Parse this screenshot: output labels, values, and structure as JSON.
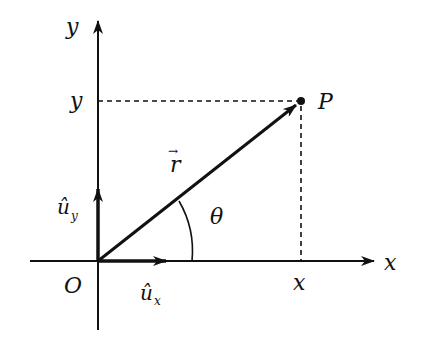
{
  "diagram": {
    "axes": {
      "x_axis_label": "x",
      "y_axis_label": "y",
      "origin_label": "O"
    },
    "point": {
      "label": "P",
      "x_projection_label": "x",
      "y_projection_label": "y"
    },
    "vector": {
      "label": "r",
      "arrow_glyph": "→"
    },
    "angle": {
      "label": "θ"
    },
    "unit_vectors": {
      "ux": {
        "base": "û",
        "subscript": "x"
      },
      "uy": {
        "base": "û",
        "subscript": "y"
      }
    },
    "colors": {
      "ink": "#111111",
      "background": "#ffffff"
    }
  }
}
